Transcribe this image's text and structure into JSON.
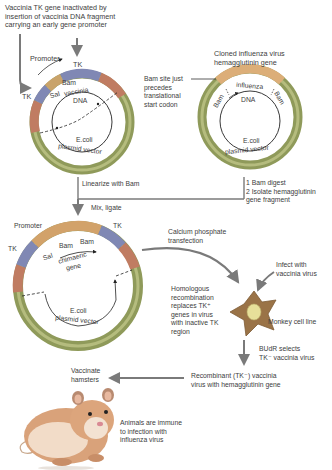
{
  "colors": {
    "vector_ring": "#8f9a5a",
    "vector_ring_light": "#b5bc7e",
    "tk_segment": "#8088b4",
    "promoter_segment": "#c9a36a",
    "vaccinia_segment": "#c07c62",
    "influenza_segment": "#dcae78",
    "arrow_gray": "#7a7a7a",
    "cell_body": "#9a7347",
    "cell_nucleus": "#e7e09a"
  },
  "top_left": {
    "caption": [
      "Vaccinia TK gene inactivated by",
      "insertion of vaccinia DNA fragment",
      "carrying an early gene promoter"
    ],
    "plasmid": {
      "promoter_label": "Promoter",
      "tk_top": "TK",
      "tk_left": "TK",
      "bam": "Bam",
      "sal": "Sal",
      "insert_label_1": "vaccinia",
      "insert_label_2": "DNA",
      "vector_label_1": "E.coli",
      "vector_label_2": "plasmid vector"
    }
  },
  "top_right": {
    "caption": [
      "Cloned influenza virus",
      "hemagglutinin gene"
    ],
    "bam_note": [
      "Bam site just",
      "precedes",
      "translational",
      "start codon"
    ],
    "plasmid": {
      "bam_left": "Bam",
      "bam_right": "Bam",
      "insert_label_1": "influenza",
      "insert_label_2": "DNA",
      "vector_label_1": "E.coli",
      "vector_label_2": "plasmid vector"
    }
  },
  "steps": {
    "linearize": "Linearize with Bam",
    "digest": [
      "1 Bam digest",
      "2 Isolate hemagglutinin",
      "  gene fragment"
    ],
    "mix_ligate": "Mix, ligate",
    "transfection": [
      "Calcium phosphate",
      "transfection"
    ],
    "infect": [
      "Infect with",
      "vaccinia virus"
    ],
    "recombination": [
      "Homologous",
      "recombination",
      "replaces TK⁺",
      "genes in virus",
      "with inactive TK",
      "region"
    ],
    "cell_line": "Monkey cell line",
    "budr": [
      "BUdR selects",
      "TK⁻ vaccinia virus"
    ],
    "recombinant": [
      "Recombinant (TK⁻) vaccinia",
      "virus with hemagglutinin gene"
    ],
    "vaccinate": [
      "Vaccinate",
      "hamsters"
    ],
    "immune": [
      "Animals are immune",
      "to infection with",
      "influenza virus"
    ]
  },
  "chimeric_plasmid": {
    "promoter_label": "Promoter",
    "tk_left": "TK",
    "tk_right": "TK",
    "bam_left": "Bam",
    "bam_right": "Bam",
    "sal": "Sal",
    "insert_label_1": "chimaeric",
    "insert_label_2": "gene",
    "vector_label_1": "E.coli",
    "vector_label_2": "plasmid vector"
  }
}
